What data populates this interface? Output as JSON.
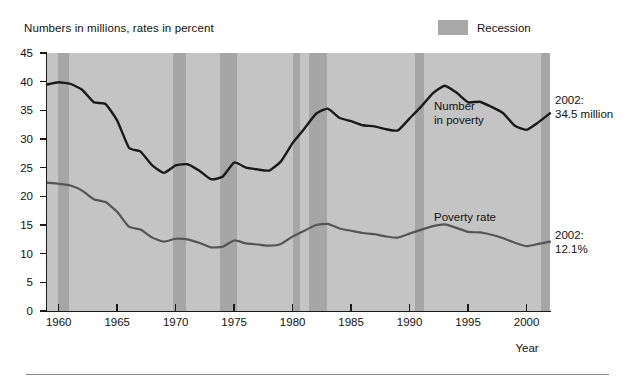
{
  "figure": {
    "top_caption": "Numbers in millions, rates in percent",
    "legend": {
      "label": "Recession",
      "swatch_color": "#a6a6a6"
    },
    "axis_title_x": "Year"
  },
  "annotations": {
    "number_line_label_line1": "Number",
    "number_line_label_line2": "in poverty",
    "rate_line_label": "Poverty rate",
    "end_note_number_line1": "2002:",
    "end_note_number_line2": "34.5 million",
    "end_note_rate_line1": "2002:",
    "end_note_rate_line2": "12.1%"
  },
  "chart_data": {
    "type": "line",
    "title": "",
    "subtitle": "Numbers in millions, rates in percent",
    "xlabel": "Year",
    "ylabel": "",
    "xlim": [
      1959,
      2002
    ],
    "ylim": [
      0,
      45
    ],
    "ytick_values": [
      0,
      5,
      10,
      15,
      20,
      25,
      30,
      35,
      40,
      45
    ],
    "xtick_values": [
      1960,
      1965,
      1970,
      1975,
      1980,
      1985,
      1990,
      1995,
      2000
    ],
    "grid": false,
    "legend_position": "top-right",
    "plot_background_color": "#c4c4c4",
    "x": [
      1959,
      1960,
      1961,
      1962,
      1963,
      1964,
      1965,
      1966,
      1967,
      1968,
      1969,
      1970,
      1971,
      1972,
      1973,
      1974,
      1975,
      1976,
      1977,
      1978,
      1979,
      1980,
      1981,
      1982,
      1983,
      1984,
      1985,
      1986,
      1987,
      1988,
      1989,
      1990,
      1991,
      1992,
      1993,
      1994,
      1995,
      1996,
      1997,
      1998,
      1999,
      2000,
      2001,
      2002
    ],
    "series": [
      {
        "name": "Number in poverty",
        "units": "millions",
        "color": "#1a1a1a",
        "values": [
          39.5,
          39.9,
          39.6,
          38.6,
          36.4,
          36.1,
          33.2,
          28.5,
          27.8,
          25.4,
          24.1,
          25.4,
          25.6,
          24.5,
          23.0,
          23.4,
          25.9,
          25.0,
          24.7,
          24.5,
          26.1,
          29.3,
          31.8,
          34.4,
          35.3,
          33.7,
          33.1,
          32.4,
          32.2,
          31.7,
          31.5,
          33.6,
          35.7,
          38.0,
          39.3,
          38.1,
          36.4,
          36.5,
          35.6,
          34.5,
          32.3,
          31.6,
          32.9,
          34.5
        ]
      },
      {
        "name": "Poverty rate",
        "units": "percent",
        "color": "#555555",
        "values": [
          22.4,
          22.2,
          21.9,
          21.0,
          19.5,
          19.0,
          17.3,
          14.7,
          14.2,
          12.8,
          12.1,
          12.6,
          12.5,
          11.9,
          11.1,
          11.2,
          12.3,
          11.8,
          11.6,
          11.4,
          11.7,
          13.0,
          14.0,
          15.0,
          15.2,
          14.4,
          14.0,
          13.6,
          13.4,
          13.0,
          12.8,
          13.5,
          14.2,
          14.8,
          15.1,
          14.5,
          13.8,
          13.7,
          13.3,
          12.7,
          11.9,
          11.3,
          11.7,
          12.1
        ]
      }
    ],
    "recession_bands": [
      {
        "start": 1959.9,
        "end": 1960.9
      },
      {
        "start": 1969.8,
        "end": 1970.9
      },
      {
        "start": 1973.8,
        "end": 1975.2
      },
      {
        "start": 1980.0,
        "end": 1980.6
      },
      {
        "start": 1981.4,
        "end": 1982.9
      },
      {
        "start": 1990.5,
        "end": 1991.2
      },
      {
        "start": 2001.2,
        "end": 2002.2
      }
    ],
    "annotations": [
      {
        "text": "Number in poverty",
        "series": "Number in poverty"
      },
      {
        "text": "Poverty rate",
        "series": "Poverty rate"
      },
      {
        "text": "2002: 34.5 million",
        "series": "Number in poverty",
        "x": 2002,
        "y": 34.5
      },
      {
        "text": "2002: 12.1%",
        "series": "Poverty rate",
        "x": 2002,
        "y": 12.1
      }
    ]
  }
}
